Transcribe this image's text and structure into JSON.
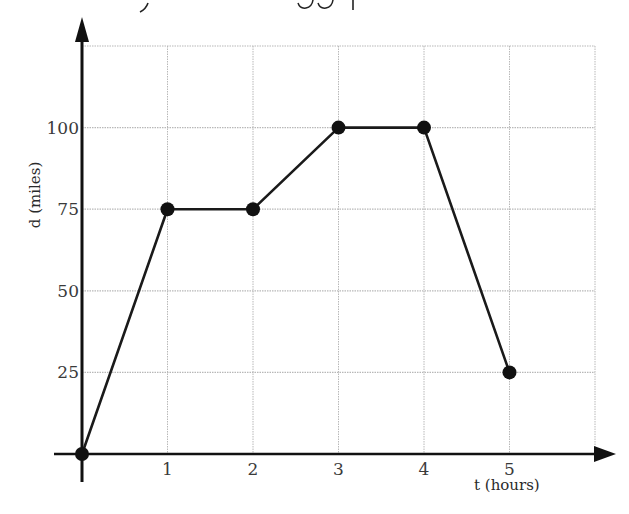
{
  "chart_data": {
    "type": "line",
    "title": "",
    "xlabel": "t (hours)",
    "ylabel": "d  (miles)",
    "x": [
      0,
      1,
      2,
      3,
      4,
      5
    ],
    "series": [
      {
        "name": "distance",
        "values": [
          0,
          75,
          75,
          100,
          100,
          25
        ]
      }
    ],
    "x_ticks": [
      "1",
      "2",
      "3",
      "4",
      "5"
    ],
    "y_ticks": [
      "25",
      "50",
      "75",
      "100"
    ],
    "xlim": [
      0,
      6
    ],
    "ylim": [
      0,
      125
    ],
    "grid": true,
    "markers": true,
    "colors": {
      "line": "#1a1a1a",
      "grid": "#b8b8b8",
      "axis": "#111111"
    }
  }
}
